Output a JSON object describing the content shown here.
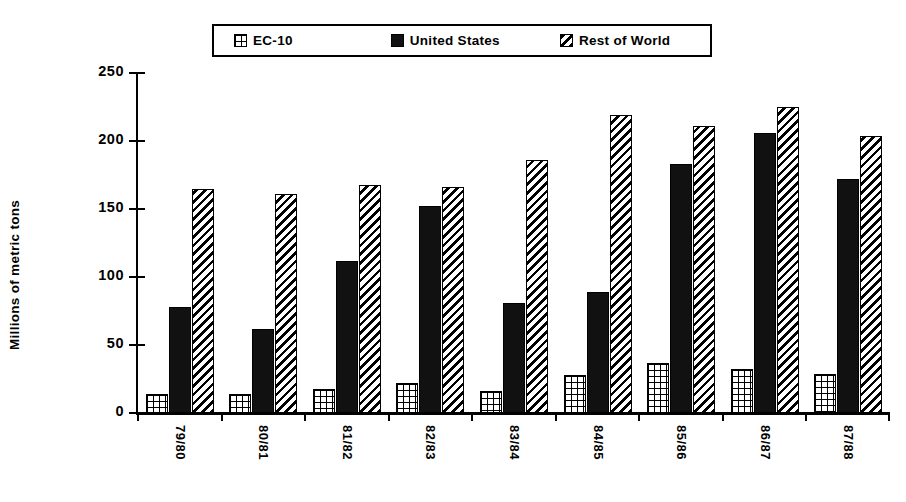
{
  "chart_data": {
    "type": "bar",
    "title": "",
    "xlabel": "",
    "ylabel": "Millions of metric tons",
    "ylim": [
      0,
      250
    ],
    "yticks": [
      0,
      50,
      100,
      150,
      200,
      250
    ],
    "grid": false,
    "legend_position": "top-center",
    "categories": [
      "79/80",
      "80/81",
      "81/82",
      "82/83",
      "83/84",
      "84/85",
      "85/86",
      "86/87",
      "87/88"
    ],
    "series": [
      {
        "name": "EC-10",
        "pattern": "grid",
        "color": "#000000",
        "values": [
          14,
          14,
          18,
          22,
          16,
          28,
          37,
          32,
          29
        ]
      },
      {
        "name": "United States",
        "pattern": "solid",
        "color": "#111111",
        "values": [
          78,
          62,
          112,
          152,
          81,
          89,
          183,
          206,
          172
        ]
      },
      {
        "name": "Rest of World",
        "pattern": "diagonal",
        "color": "#000000",
        "values": [
          165,
          161,
          168,
          166,
          186,
          219,
          211,
          225,
          204
        ]
      }
    ]
  },
  "axis": {
    "y_title": "Millions of metric tons",
    "tick_labels": [
      "0",
      "50",
      "100",
      "150",
      "200",
      "250"
    ]
  },
  "legend": {
    "items": [
      {
        "label": "EC-10",
        "swatch": "grid-swatch-icon"
      },
      {
        "label": "United States",
        "swatch": "solid-swatch-icon"
      },
      {
        "label": "Rest of World",
        "swatch": "diagonal-swatch-icon"
      }
    ]
  }
}
